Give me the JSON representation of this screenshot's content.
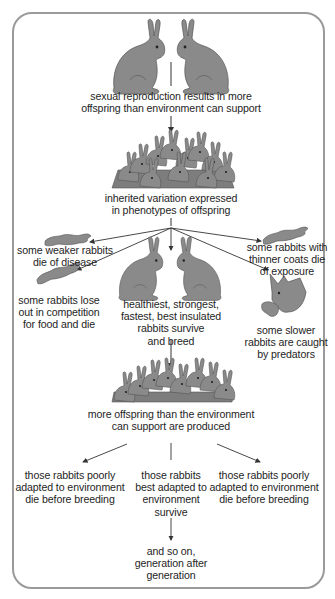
{
  "diagram": {
    "colors": {
      "rabbit_fill": "#8a8a8a",
      "rabbit_stroke": "#555555",
      "frame": "#9a9a9a",
      "arrow": "#333333"
    },
    "nodes": {
      "parents": {
        "icon": "two-rabbits-facing",
        "label": "sexual reproduction results in more\noffspring than environment can support"
      },
      "offspring": {
        "icon": "rabbit-pile",
        "label": "inherited variation expressed\nin phenotypes of offspring"
      },
      "weaker": {
        "icon": "dead-rabbit",
        "label": "some weaker rabbits\ndie of disease"
      },
      "competition": {
        "icon": "dead-rabbit",
        "label": "some rabbits lose\nout in competition\nfor food and die"
      },
      "survivors": {
        "icon": "two-rabbits-facing",
        "label": "healthiest, strongest,\nfastest, best insulated\nrabbits survive\nand breed"
      },
      "exposure": {
        "icon": "dead-rabbit",
        "label": "some rabbits with\nthinner coats die\nof exposure"
      },
      "predators": {
        "icon": "fox-with-rabbit",
        "label": "some slower\nrabbits are caught\nby predators"
      },
      "overproduction": {
        "icon": "rabbit-pile",
        "label": "more offspring than the environment\ncan support are produced"
      },
      "poorly_left": {
        "label": "those rabbits poorly\nadapted to environment\ndie before breeding"
      },
      "best_adapted": {
        "label": "those rabbits\nbest adapted to\nenvironment\nsurvive"
      },
      "poorly_right": {
        "label": "those rabbits poorly\nadapted to environment\ndie before breeding"
      },
      "continues": {
        "label": "and so on,\ngeneration after\ngeneration"
      }
    }
  }
}
